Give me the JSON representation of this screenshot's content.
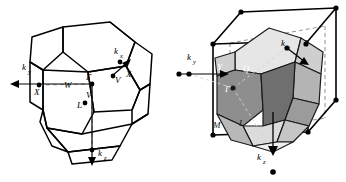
{
  "figure": {
    "type": "two-panel-geometry-diagram",
    "background_color": "#ffffff",
    "line_color": "#000000",
    "dash_color": "#9a9a9a"
  },
  "panels": [
    {
      "id": "left",
      "name": "wireframe-truncated-octahedron",
      "description": "Open wireframe truncated octahedron with symmetry point labels",
      "axes": [
        {
          "name": "k_y",
          "label": "k",
          "sub": "y",
          "direction": "left",
          "arrow": "◀"
        },
        {
          "name": "k_x",
          "label": "k",
          "sub": "x",
          "direction": "upper-right",
          "arrow": "▶"
        },
        {
          "name": "k_z",
          "label": "k",
          "sub": "z",
          "direction": "down",
          "arrow": "▼"
        }
      ],
      "points": [
        {
          "label": "X",
          "name": "point-x-left",
          "x": 39,
          "y": 85
        },
        {
          "label": "Γ",
          "name": "point-gamma",
          "x": 92,
          "y": 84
        },
        {
          "label": "W",
          "name": "point-w-mid",
          "x": 69,
          "y": 79
        },
        {
          "label": "V",
          "name": "point-v",
          "x": 90,
          "y": 92
        },
        {
          "label": "L",
          "name": "point-l",
          "x": 85,
          "y": 103
        },
        {
          "label": "X",
          "name": "point-x-right",
          "x": 123,
          "y": 73
        },
        {
          "label": "V",
          "name": "point-v-right",
          "x": 113,
          "y": 76
        },
        {
          "label": "W",
          "name": "point-w-top",
          "x": 120,
          "y": 62
        }
      ]
    },
    {
      "id": "right",
      "name": "shaded-truncated-octahedron-in-cube",
      "description": "Grey-shaded truncated octahedron inscribed inside a cube outline with vertex dots",
      "axes": [
        {
          "name": "k_y",
          "label": "k",
          "sub": "y",
          "direction": "right",
          "arrow": "▶"
        },
        {
          "name": "k_x",
          "label": "k",
          "sub": "x",
          "direction": "lower-right",
          "arrow": "▶"
        },
        {
          "name": "k_z",
          "label": "k",
          "sub": "z",
          "direction": "down",
          "arrow": "▼"
        }
      ],
      "points": [
        {
          "label": "X",
          "name": "point-x",
          "x": 16,
          "y": 74
        },
        {
          "label": "Y",
          "name": "point-y",
          "x": 48,
          "y": 66
        },
        {
          "label": "Q",
          "name": "point-q",
          "x": 74,
          "y": 68
        },
        {
          "label": "Γ",
          "name": "point-gamma",
          "x": 60,
          "y": 88
        },
        {
          "label": "M",
          "name": "point-m",
          "x": 45,
          "y": 124
        },
        {
          "label": "L",
          "name": "point-l",
          "x": 68,
          "y": 121
        },
        {
          "label": "W",
          "name": "point-w",
          "x": 114,
          "y": 48
        }
      ],
      "face_shades": {
        "lightest": "#e6e6e6",
        "light": "#cfcfcf",
        "mid": "#b4b4b4",
        "dark": "#8e8e8e",
        "darkest": "#6f6f6f"
      }
    }
  ]
}
